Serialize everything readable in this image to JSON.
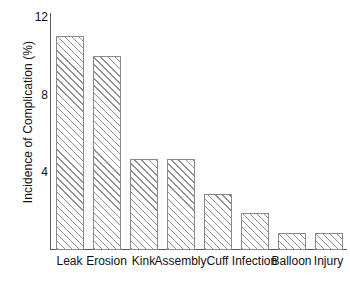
{
  "chart_data": {
    "type": "bar",
    "title": "",
    "xlabel": "",
    "ylabel": "Incidence of Complication (%)",
    "categories": [
      "Leak",
      "Erosion",
      "Kink",
      "Assembly",
      "Cuff",
      "Infection",
      "Balloon",
      "Injury"
    ],
    "values": [
      11.0,
      10.0,
      4.7,
      4.7,
      2.9,
      1.9,
      0.9,
      0.9
    ],
    "ylim": [
      0,
      12.2
    ],
    "yticks": [
      4,
      8,
      12
    ],
    "ytick_labels": [
      "4",
      "8",
      "12"
    ],
    "grid": false,
    "legend": null,
    "series": [
      {
        "name": "Incidence of Complication (%)",
        "values": [
          11.0,
          10.0,
          4.7,
          4.7,
          2.9,
          1.9,
          0.9,
          0.9
        ]
      }
    ],
    "style": {
      "bar_fill": "#ffffff",
      "bar_hatch": "forward-diagonal",
      "bar_hatch_color": "#8f8f8f",
      "bar_border_color": "#8a8a8a",
      "axis_color": "#5a5a5a",
      "text_color": "#111111",
      "background": "#ffffff"
    }
  }
}
